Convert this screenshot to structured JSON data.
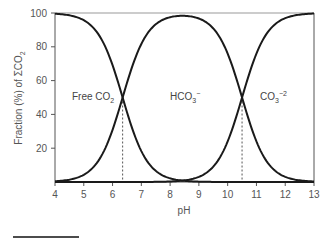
{
  "chart_data": {
    "type": "line",
    "title": "",
    "xlabel": "pH",
    "ylabel": "Fraction (%) of ΣCO2",
    "xlim": [
      4,
      13
    ],
    "ylim": [
      0,
      100
    ],
    "x_ticks": [
      4,
      5,
      6,
      7,
      8,
      9,
      10,
      11,
      12,
      13
    ],
    "y_ticks": [
      20,
      40,
      60,
      80,
      100
    ],
    "grid": false,
    "legend": null,
    "pKa1": 6.35,
    "pKa2": 10.5,
    "x": [
      4.0,
      4.5,
      5.0,
      5.5,
      6.0,
      6.35,
      6.5,
      7.0,
      7.5,
      8.0,
      8.5,
      9.0,
      9.5,
      10.0,
      10.5,
      11.0,
      11.5,
      12.0,
      12.5,
      13.0
    ],
    "series": [
      {
        "name": "Free CO2",
        "values": [
          99.6,
          98.6,
          95.7,
          87.6,
          69.1,
          50.0,
          41.5,
          18.3,
          6.6,
          2.2,
          0.7,
          0.2,
          0.1,
          0.0,
          0.0,
          0.0,
          0.0,
          0.0,
          0.0,
          0.0
        ]
      },
      {
        "name": "HCO3-",
        "values": [
          0.4,
          1.4,
          4.3,
          12.4,
          30.9,
          49.9,
          58.5,
          81.4,
          92.7,
          96.8,
          97.9,
          96.6,
          91.0,
          75.9,
          50.0,
          24.0,
          9.1,
          3.1,
          1.0,
          0.3
        ]
      },
      {
        "name": "CO3-2",
        "values": [
          0.0,
          0.0,
          0.0,
          0.0,
          0.0,
          0.0,
          0.0,
          0.3,
          0.7,
          1.0,
          1.4,
          3.2,
          8.9,
          24.1,
          50.0,
          76.0,
          90.9,
          96.9,
          99.0,
          99.7
        ]
      }
    ],
    "annotations": [
      {
        "text": "Free CO2",
        "x": 5.0,
        "y": 50
      },
      {
        "text": "HCO3-",
        "x": 8.5,
        "y": 50
      },
      {
        "text": "CO3-2",
        "x": 11.5,
        "y": 50
      }
    ],
    "reference_lines": [
      {
        "type": "vertical",
        "x": 6.35,
        "style": "dashed"
      },
      {
        "type": "vertical",
        "x": 10.5,
        "style": "dashed"
      }
    ]
  },
  "labels": {
    "xlabel": "pH",
    "ylabel_main": "Fraction (%) of ΣCO",
    "ylabel_sub": "2",
    "free_co2_main": "Free CO",
    "free_co2_sub": "2",
    "hco3_main": "HCO",
    "hco3_sub": "3",
    "hco3_sup": "−",
    "co3_main": "CO",
    "co3_sub": "3",
    "co3_sup": "−2"
  },
  "colors": {
    "curve": "#1a1a1a",
    "axis": "#555555",
    "frame_top": "#999999",
    "dashed": "#555555"
  }
}
